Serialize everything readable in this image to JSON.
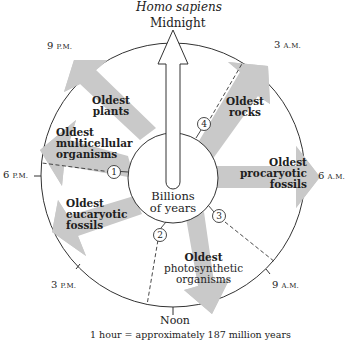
{
  "header": {
    "species": "Homo sapiens",
    "top_label": "Midnight"
  },
  "clock": {
    "times": {
      "midnight": "Midnight",
      "three_am": {
        "num": "3",
        "suffix": "A.M."
      },
      "six_am": {
        "num": "6",
        "suffix": "A.M."
      },
      "nine_am": {
        "num": "9",
        "suffix": "A.M."
      },
      "noon": "Noon",
      "three_pm": {
        "num": "3",
        "suffix": "P.M."
      },
      "six_pm": {
        "num": "6",
        "suffix": "P.M."
      },
      "nine_pm": {
        "num": "9",
        "suffix": "P.M."
      }
    },
    "center": {
      "line1": "Billions",
      "line2": "of years"
    },
    "markers": [
      "1",
      "2",
      "3",
      "4"
    ]
  },
  "events": {
    "rocks": {
      "line1": "Oldest",
      "line2": "rocks"
    },
    "procaryotic": {
      "line1": "Oldest",
      "line2": "procaryotic",
      "line3": "fossils"
    },
    "photosynthetic": {
      "line1": "Oldest",
      "line2": "photosynthetic",
      "line3": "organisms"
    },
    "eucaryotic": {
      "line1": "Oldest",
      "line2": "eucaryotic",
      "line3": "fossils"
    },
    "multicellular": {
      "line1": "Oldest",
      "line2": "multicellular",
      "line3": "organisms"
    },
    "plants": {
      "line1": "Oldest",
      "line2": "plants"
    }
  },
  "caption": "1 hour = approximately 187 million years",
  "colors": {
    "arrow_fill": "#c9c9c9",
    "line": "#333333",
    "background": "#ffffff"
  }
}
